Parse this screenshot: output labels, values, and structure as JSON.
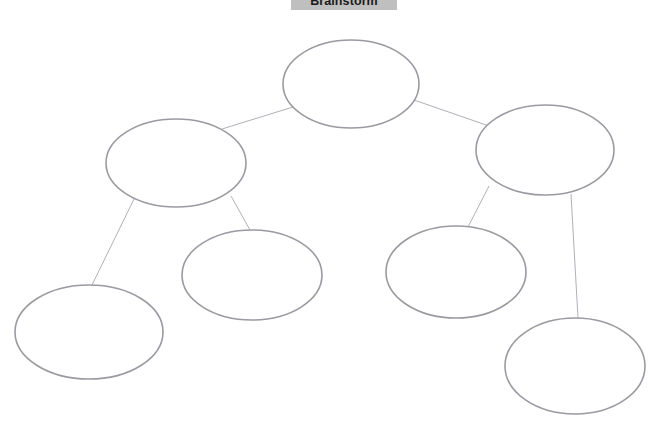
{
  "document": {
    "title": "Brainstorm",
    "background_color": "#ffffff",
    "title_chip_color": "#bfbfbf",
    "title_text_color": "#1a1a1a"
  },
  "diagram": {
    "type": "concept-map",
    "shape": "ellipse",
    "node_outline_color": "#9a9aa2",
    "node_fill_color": "#ffffff",
    "connector_color": "#b0b0b8",
    "node_count": 7,
    "connector_count": 6,
    "nodes": [
      {
        "id": "root",
        "label": "",
        "cx": 351,
        "cy": 84,
        "rx": 68,
        "ry": 44
      },
      {
        "id": "branch-left",
        "label": "",
        "cx": 176,
        "cy": 163,
        "rx": 70,
        "ry": 44
      },
      {
        "id": "branch-right",
        "label": "",
        "cx": 545,
        "cy": 150,
        "rx": 69,
        "ry": 45
      },
      {
        "id": "leaf-1",
        "label": "",
        "cx": 89,
        "cy": 332,
        "rx": 74,
        "ry": 47
      },
      {
        "id": "leaf-2",
        "label": "",
        "cx": 252,
        "cy": 275,
        "rx": 70,
        "ry": 45
      },
      {
        "id": "leaf-3",
        "label": "",
        "cx": 456,
        "cy": 272,
        "rx": 70,
        "ry": 46
      },
      {
        "id": "leaf-4",
        "label": "",
        "cx": 575,
        "cy": 366,
        "rx": 70,
        "ry": 48
      }
    ],
    "connectors": [
      {
        "id": "root-to-branch-left",
        "from": "root",
        "to": "branch-left",
        "x1": 293,
        "y1": 107,
        "x2": 222,
        "y2": 129
      },
      {
        "id": "root-to-branch-right",
        "from": "root",
        "to": "branch-right",
        "x1": 414,
        "y1": 100,
        "x2": 489,
        "y2": 126
      },
      {
        "id": "branch-left-to-leaf-1",
        "from": "branch-left",
        "to": "leaf-1",
        "x1": 134,
        "y1": 199,
        "x2": 92,
        "y2": 285
      },
      {
        "id": "branch-left-to-leaf-2",
        "from": "branch-left",
        "to": "leaf-2",
        "x1": 231,
        "y1": 196,
        "x2": 250,
        "y2": 230
      },
      {
        "id": "branch-right-to-leaf-3",
        "from": "branch-right",
        "to": "leaf-3",
        "x1": 489,
        "y1": 186,
        "x2": 468,
        "y2": 227
      },
      {
        "id": "branch-right-to-leaf-4",
        "from": "branch-right",
        "to": "leaf-4",
        "x1": 571,
        "y1": 194,
        "x2": 578,
        "y2": 318
      }
    ]
  }
}
